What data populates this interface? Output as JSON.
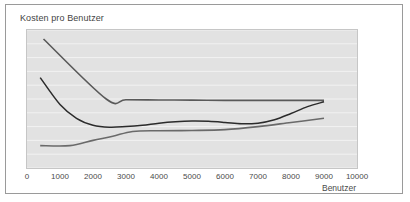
{
  "figure": {
    "title": "Kosten pro Benutzer",
    "background": "#ffffff",
    "plot_background": "#e2e2e2",
    "border_color": "#9a9a9a"
  },
  "chart_data": {
    "type": "line",
    "title": "Kosten pro Benutzer",
    "xlabel": "Benutzer",
    "ylabel": "",
    "xlim": [
      0,
      10000
    ],
    "ylim": [
      0,
      10
    ],
    "grid": true,
    "grid_axis": "y",
    "grid_lines": 10,
    "y_ticks_visible": false,
    "legend": null,
    "legend_position": "none",
    "xticks": [
      0,
      1000,
      2000,
      3000,
      4000,
      5000,
      6000,
      7000,
      8000,
      9000,
      10000
    ],
    "xticklabels": [
      "0",
      "1000",
      "2000",
      "3000",
      "4000",
      "5000",
      "6000",
      "7000",
      "8000",
      "9000",
      "10000"
    ],
    "series": [
      {
        "name": "Fixkosten pro Benutzer",
        "color": "#595959",
        "width": 1.6,
        "x": [
          500,
          2400,
          3000,
          4000,
          5000,
          6000,
          7000,
          8000,
          9000
        ],
        "y": [
          9.35,
          5.0,
          4.95,
          4.93,
          4.92,
          4.9,
          4.9,
          4.9,
          4.9
        ]
      },
      {
        "name": "Gesamtkosten pro Benutzer",
        "color": "#2b2b2b",
        "width": 1.5,
        "x": [
          400,
          1000,
          1500,
          2000,
          2500,
          3000,
          3500,
          4000,
          4500,
          5000,
          5500,
          6000,
          6500,
          7000,
          7500,
          8000,
          8500,
          9000
        ],
        "y": [
          6.55,
          4.6,
          3.6,
          3.1,
          2.95,
          3.0,
          3.1,
          3.25,
          3.35,
          3.4,
          3.38,
          3.3,
          3.2,
          3.25,
          3.5,
          3.95,
          4.45,
          4.8
        ]
      },
      {
        "name": "Variable Kosten pro Benutzer",
        "color": "#6a6a6a",
        "width": 1.6,
        "x": [
          400,
          1300,
          2000,
          2600,
          3200,
          4000,
          5000,
          6000,
          7000,
          8000,
          9000
        ],
        "y": [
          1.62,
          1.62,
          2.0,
          2.3,
          2.65,
          2.7,
          2.72,
          2.78,
          3.0,
          3.3,
          3.6
        ]
      }
    ]
  },
  "x_axis": {
    "title": "Benutzer"
  }
}
